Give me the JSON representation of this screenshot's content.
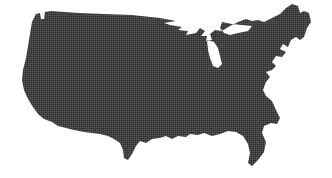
{
  "figure": {
    "kind": "silhouette-map",
    "subject": "Contiguous United States",
    "alt_text": "Solid dark silhouette of the contiguous United States",
    "width": 332,
    "height": 178,
    "background_color": "#ffffff",
    "land_color": "#2e2e2e",
    "texture": "halftone-dither",
    "caption": "",
    "title": "",
    "labels": [],
    "legend": [],
    "annotations": []
  },
  "regions": {
    "landmass_name": "contiguous-united-states",
    "water_cutouts": [
      {
        "name": "Lake Superior"
      },
      {
        "name": "Lake Michigan"
      },
      {
        "name": "Lake Huron"
      },
      {
        "name": "Lake Erie"
      },
      {
        "name": "Lake Ontario"
      },
      {
        "name": "Puget Sound"
      },
      {
        "name": "Chesapeake Bay"
      },
      {
        "name": "Gulf of Mexico"
      }
    ],
    "features": [
      {
        "name": "Pacific Northwest coast"
      },
      {
        "name": "California coast"
      },
      {
        "name": "Baja / Mexican border"
      },
      {
        "name": "Texas gulf coast"
      },
      {
        "name": "Florida peninsula"
      },
      {
        "name": "Atlantic seaboard"
      },
      {
        "name": "Maine northeast tip"
      },
      {
        "name": "Canadian border"
      }
    ]
  }
}
